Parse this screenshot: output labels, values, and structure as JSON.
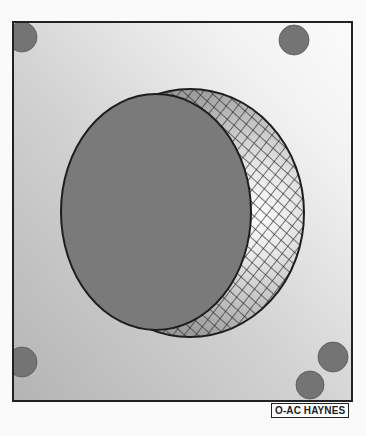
{
  "figure": {
    "credit_label": "O-AC HAYNES",
    "colors": {
      "background": "#fafafa",
      "panel_light": "#f4f4f4",
      "panel_dark": "#b9b9b9",
      "frame": "#222222",
      "disc": "#7a7a7a",
      "dot": "#747474",
      "hatch_line": "#2a2a2a",
      "crescent_highlight": "#ffffff",
      "crescent_shadow": "#9a9a9a"
    },
    "frame": {
      "x": 13,
      "y": 22,
      "width": 339,
      "height": 379
    },
    "sphere": {
      "cx": 190,
      "cy": 213,
      "rx": 114,
      "ry": 124
    },
    "disc": {
      "cx": 156,
      "cy": 212,
      "rx": 95,
      "ry": 118
    },
    "dots": [
      {
        "name": "top-left",
        "cx": 22,
        "cy": 37,
        "r": 15
      },
      {
        "name": "top-right",
        "cx": 294,
        "cy": 40,
        "r": 15
      },
      {
        "name": "bottom-left",
        "cx": 22,
        "cy": 362,
        "r": 15
      },
      {
        "name": "bottom-right-upper",
        "cx": 333,
        "cy": 357,
        "r": 15
      },
      {
        "name": "bottom-right-lower",
        "cx": 310,
        "cy": 385,
        "r": 14
      }
    ]
  }
}
